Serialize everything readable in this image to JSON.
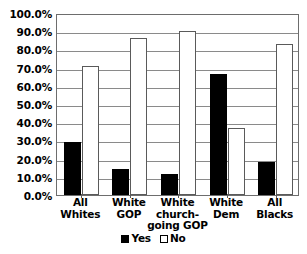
{
  "chart_data": {
    "type": "bar",
    "title": "",
    "subtitle": "",
    "xlabel": "",
    "ylabel": "",
    "ylim": [
      0,
      100
    ],
    "grid": true,
    "legend_position": "bottom-center",
    "categories": [
      "All Whites",
      "White GOP",
      "White church-going GOP",
      "White Dem",
      "All Blacks"
    ],
    "category_lines": [
      [
        "All",
        "Whites"
      ],
      [
        "White",
        "GOP"
      ],
      [
        "White",
        "church-",
        "going GOP"
      ],
      [
        "White",
        "Dem"
      ],
      [
        "All",
        "Blacks"
      ]
    ],
    "series": [
      {
        "name": "Yes",
        "color": "#000000",
        "values": [
          29.0,
          14.5,
          11.5,
          66.5,
          18.0
        ]
      },
      {
        "name": "No",
        "color": "#ffffff",
        "values": [
          71.0,
          86.0,
          90.0,
          37.0,
          83.0
        ]
      }
    ],
    "ytick_labels": [
      "0.0%",
      "10.0%",
      "20.0%",
      "30.0%",
      "40.0%",
      "50.0%",
      "60.0%",
      "70.0%",
      "80.0%",
      "90.0%",
      "100.0%"
    ],
    "ytick_values": [
      0,
      10,
      20,
      30,
      40,
      50,
      60,
      70,
      80,
      90,
      100
    ]
  },
  "legend": {
    "items": [
      {
        "label": "Yes"
      },
      {
        "label": "No"
      }
    ]
  },
  "colors": {
    "yes_fill": "#000000",
    "no_fill": "#ffffff",
    "bar_outline": "#5a5a5a",
    "gridline": "#8a8a8a",
    "axis": "#6d6d6d",
    "text": "#000000"
  }
}
